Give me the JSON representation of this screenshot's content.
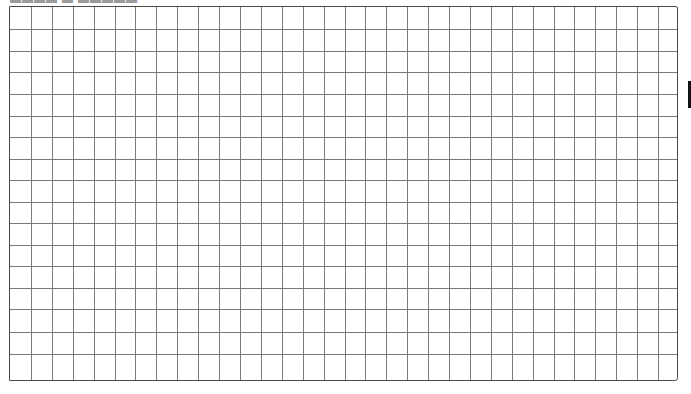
{
  "page": {
    "clipped_header_text": "▬▬▬▬ ▬ ▬▬▬▬▬"
  },
  "grid": {
    "columns": 32,
    "rows": 17,
    "line_color": "#7a7a7a",
    "border_color": "#4a4a4a",
    "background_color": "#ffffff",
    "row_line_positions": [
      0,
      22,
      44,
      65,
      87,
      109,
      130,
      152,
      173,
      195,
      216,
      238,
      259,
      281,
      302,
      325,
      347,
      375
    ]
  },
  "edge_marker": {
    "color": "#111111"
  }
}
